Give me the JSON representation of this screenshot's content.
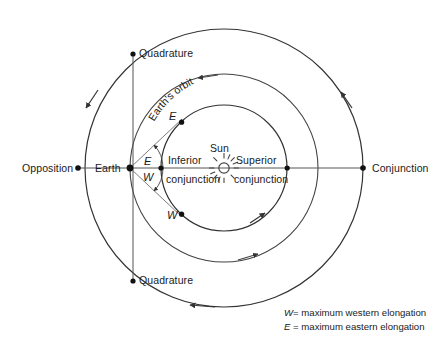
{
  "diagram": {
    "center_body": "Sun",
    "colors": {
      "stroke": "#333333",
      "thin_stroke": "#555555",
      "text": "#1a1a1a",
      "background": "#ffffff"
    },
    "labels": {
      "opposition": "Opposition",
      "conjunction": "Conjunction",
      "quadrature_top": "Quadrature",
      "quadrature_bottom": "Quadrature",
      "earth": "Earth",
      "sun": "Sun",
      "inferior_line1": "Inferior",
      "inferior_line2": "conjunction",
      "superior_line1": "Superior",
      "superior_line2": "conjunction",
      "earths_orbit": "Earth's orbit",
      "elongation_east": "E",
      "elongation_west": "W",
      "point_east": "E",
      "point_west": "W"
    },
    "legend": [
      {
        "symbol": "W",
        "equals": "=",
        "text": "maximum western elongation"
      },
      {
        "symbol": "E",
        "equals": "=",
        "text": "maximum eastern elongation"
      }
    ],
    "geometry": {
      "sun_center_x": 224,
      "sun_center_y": 168,
      "inner_orbit_radius": 63,
      "earth_orbit_radius": 94,
      "outer_orbit_radius": 139,
      "earth_point_x": 130,
      "earth_point_y": 168,
      "opposition_point_x": 78,
      "opposition_point_y": 168,
      "conjunction_point_x": 363,
      "conjunction_point_y": 168,
      "quadrature_top_x": 133,
      "quadrature_top_y": 54,
      "quadrature_bottom_x": 133,
      "quadrature_bottom_y": 281,
      "point_e_x": 178,
      "point_e_y": 123,
      "point_w_x": 178,
      "point_w_y": 213
    }
  }
}
